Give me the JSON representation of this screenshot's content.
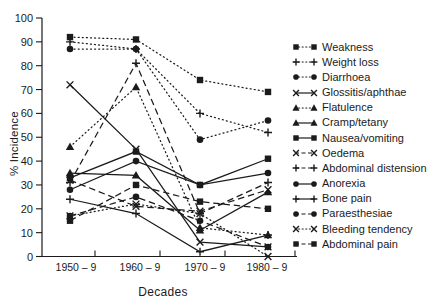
{
  "chart_data": {
    "type": "line",
    "title": "",
    "xlabel": "Decades",
    "ylabel": "% Incidence",
    "categories": [
      "1950 – 9",
      "1960 – 9",
      "1970 – 9",
      "1980 – 9"
    ],
    "y_ticks": [
      0,
      10,
      20,
      30,
      40,
      50,
      60,
      70,
      80,
      90,
      100
    ],
    "ylim": [
      0,
      100
    ],
    "grid": false,
    "legend_position": "right",
    "line_color": "#1b1b1b",
    "series": [
      {
        "name": "Weakness",
        "marker": "square",
        "line": "dotted",
        "values": [
          92,
          91,
          74,
          69
        ]
      },
      {
        "name": "Weight loss",
        "marker": "plus",
        "line": "dotted",
        "values": [
          90,
          87,
          60,
          52
        ]
      },
      {
        "name": "Diarrhoea",
        "marker": "circle",
        "line": "dotted",
        "values": [
          87,
          87,
          49,
          57
        ]
      },
      {
        "name": "Glossitis/aphthae",
        "marker": "x",
        "line": "solid",
        "values": [
          72,
          45,
          6,
          4
        ]
      },
      {
        "name": "Flatulence",
        "marker": "triangle",
        "line": "dotted",
        "values": [
          46,
          71,
          12,
          9
        ]
      },
      {
        "name": "Cramp/tetany",
        "marker": "triangle",
        "line": "solid",
        "values": [
          35,
          34,
          11,
          27
        ]
      },
      {
        "name": "Nausea/vomiting",
        "marker": "square",
        "line": "solid",
        "values": [
          33,
          44,
          30,
          41
        ]
      },
      {
        "name": "Oedema",
        "marker": "x",
        "line": "dashed",
        "values": [
          32,
          21,
          19,
          28
        ]
      },
      {
        "name": "Abdominal distension",
        "marker": "plus",
        "line": "dashed",
        "values": [
          31,
          81,
          18,
          31
        ]
      },
      {
        "name": "Anorexia",
        "marker": "circle",
        "line": "solid",
        "values": [
          28,
          40,
          30,
          35
        ]
      },
      {
        "name": "Bone pain",
        "marker": "plus",
        "line": "solid",
        "values": [
          24,
          18,
          2,
          9
        ]
      },
      {
        "name": "Paraesthesiae",
        "marker": "circle",
        "line": "dashed",
        "values": [
          17,
          25,
          15,
          4
        ]
      },
      {
        "name": "Bleeding tendency",
        "marker": "x",
        "line": "dotted",
        "values": [
          17,
          22,
          18,
          0
        ]
      },
      {
        "name": "Abdominal pain",
        "marker": "square",
        "line": "dashed",
        "values": [
          15,
          30,
          23,
          20
        ]
      }
    ]
  }
}
